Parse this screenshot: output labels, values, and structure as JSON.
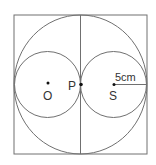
{
  "diagram": {
    "labels": {
      "O": "O",
      "P": "P",
      "S": "S",
      "radius": "5cm"
    },
    "colors": {
      "stroke": "#707070",
      "text": "#333333",
      "point": "#111111"
    }
  }
}
